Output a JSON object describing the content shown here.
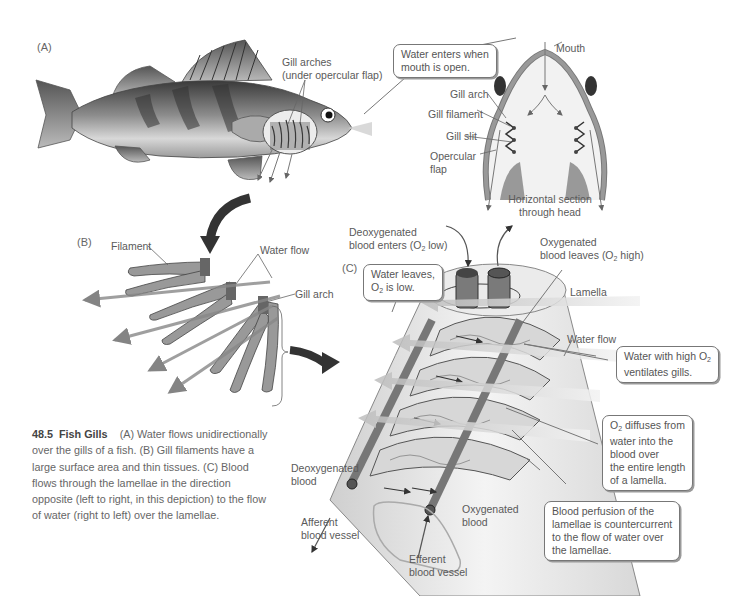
{
  "figure": {
    "number": "48.5",
    "title": "Fish Gills",
    "caption": "(A) Water flows unidirectionally over the gills of a fish. (B) Gill filaments have a large surface area and thin tissues. (C) Blood flows through the lamellae in the direction opposite (left to right, in this depiction) to the flow of water (right to left) over the lamellae."
  },
  "panel_a": {
    "label": "(A)",
    "gill_arches_label_1": "Gill arches",
    "gill_arches_label_2": "(under opercular flap)",
    "callout_water_enters_1": "Water enters when",
    "callout_water_enters_2": "mouth is open.",
    "mouth": "Mouth",
    "gill_arch": "Gill arch",
    "gill_filament": "Gill filament",
    "gill_slit": "Gill slit",
    "opercular_1": "Opercular",
    "opercular_2": "flap",
    "section_1": "Horizontal section",
    "section_2": "through head"
  },
  "panel_b": {
    "label": "(B)",
    "filament": "Filament",
    "water_flow": "Water flow",
    "gill_arch": "Gill arch"
  },
  "panel_c": {
    "label": "(C)",
    "deoxy_enters_1": "Deoxygenated",
    "deoxy_enters_2": "blood enters (O",
    "deoxy_enters_sub": "2",
    "deoxy_enters_3": " low)",
    "oxy_leaves_1": "Oxygenated",
    "oxy_leaves_2": "blood leaves (O",
    "oxy_leaves_sub": "2",
    "oxy_leaves_3": " high)",
    "callout_water_leaves_1": "Water leaves,",
    "callout_water_leaves_2a": "O",
    "callout_water_leaves_sub": "2",
    "callout_water_leaves_2b": " is low.",
    "lamella": "Lamella",
    "water_flow": "Water flow",
    "callout_high_o2_1a": "Water with high O",
    "callout_high_o2_sub": "2",
    "callout_high_o2_2": "ventilates gills.",
    "callout_diffuses_1a": "O",
    "callout_diffuses_sub": "2",
    "callout_diffuses_1b": " diffuses from",
    "callout_diffuses_2": "water into the",
    "callout_diffuses_3": "blood over",
    "callout_diffuses_4": "the entire length",
    "callout_diffuses_5": "of a lamella.",
    "callout_perfusion_1": "Blood perfusion of the",
    "callout_perfusion_2": "lamellae is countercurrent",
    "callout_perfusion_3": "to the flow of water over",
    "callout_perfusion_4": "the lamellae.",
    "deoxy_blood_1": "Deoxygenated",
    "deoxy_blood_2": "blood",
    "afferent_1": "Afferent",
    "afferent_2": "blood vessel",
    "oxy_blood_1": "Oxygenated",
    "oxy_blood_2": "blood",
    "efferent_1": "Efferent",
    "efferent_2": "blood vessel"
  },
  "colors": {
    "ink": "#555555",
    "dark_arrow": "#333333",
    "tissue": "#8a8a8a",
    "water_arrow": "#c8c8c8"
  }
}
